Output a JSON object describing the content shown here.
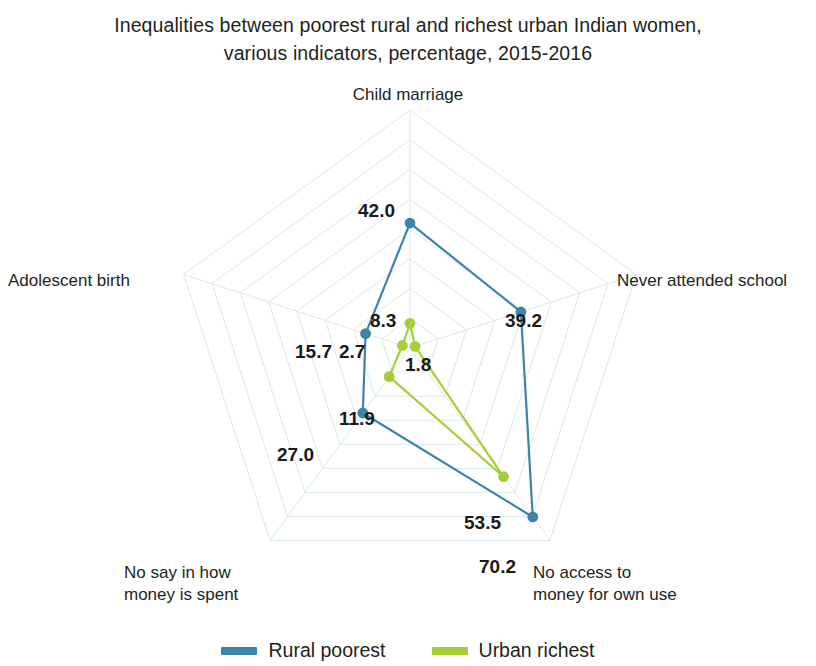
{
  "title": {
    "line1": "Inequalities between poorest rural and richest urban Indian women,",
    "line2": "various indicators, percentage, 2015-2016"
  },
  "legend": {
    "items": [
      {
        "label": "Rural poorest",
        "color": "#3D85A8"
      },
      {
        "label": "Urban richest",
        "color": "#A6CE39"
      }
    ]
  },
  "axis_labels": {
    "child_marriage": "Child marriage",
    "never_attended_school": "Never attended school",
    "no_access_money": "No access to\nmoney for own use",
    "no_say_money": "No say in how\nmoney is spent",
    "adolescent_birth": "Adolescent birth"
  },
  "value_labels": {
    "rural_child_marriage": "42.0",
    "rural_never_school": "39.2",
    "rural_no_access": "70.2",
    "rural_no_say": "27.0",
    "rural_adolescent": "15.7",
    "urban_child_marriage": "8.3",
    "urban_never_school": "1.8",
    "urban_no_access": "53.5",
    "urban_no_say": "11.9",
    "urban_adolescent": "2.7"
  },
  "chart_data": {
    "type": "line",
    "subtype": "radar",
    "title": "Inequalities between poorest rural and richest urban Indian women, various indicators, percentage, 2015-2016",
    "categories": [
      "Child marriage",
      "Never attended school",
      "No access to money for own use",
      "No say in how money is spent",
      "Adolescent birth"
    ],
    "series": [
      {
        "name": "Rural poorest",
        "color": "#3D85A8",
        "values": [
          42.0,
          39.2,
          70.2,
          27.0,
          15.7
        ]
      },
      {
        "name": "Urban richest",
        "color": "#A6CE39",
        "values": [
          8.3,
          1.8,
          53.5,
          11.9,
          2.7
        ]
      }
    ],
    "rmin": 0,
    "rmax": 80,
    "rings": 8,
    "grid": true,
    "grid_color": "#d8e8ef",
    "legend_position": "bottom",
    "xlabel": "",
    "ylabel": "",
    "units": "percentage",
    "period": "2015-2016"
  }
}
